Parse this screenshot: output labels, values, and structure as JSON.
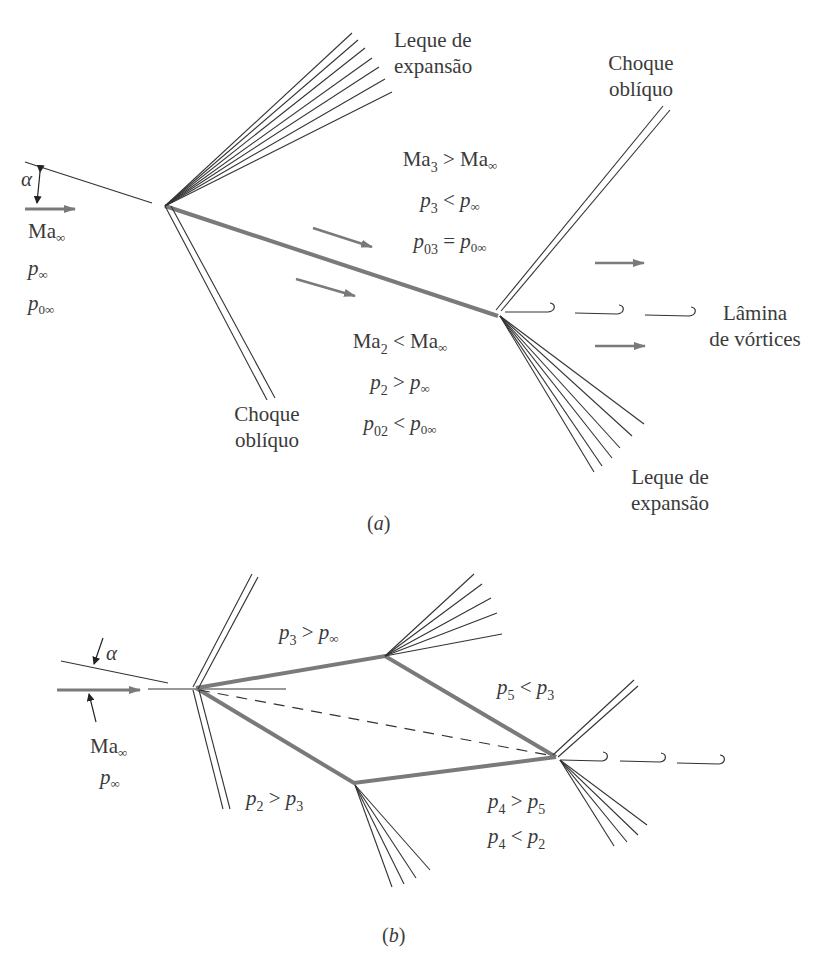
{
  "diagram": {
    "type": "supersonic-airfoil-wave-patterns",
    "colors": {
      "line": "#333333",
      "plate": "#7a7a7a",
      "arrow": "#7a7a7a",
      "text": "#3a3a3a",
      "background": "#ffffff"
    }
  },
  "panel_a": {
    "caption": {
      "open": "(",
      "letter": "a",
      "close": ")"
    },
    "alpha": "α",
    "freestream": {
      "mach": {
        "base": "Ma",
        "sub": "∞"
      },
      "pressure": {
        "base": "p",
        "sub": "∞"
      },
      "total_pressure": {
        "base": "p",
        "sub": "0∞"
      }
    },
    "expansion_fan_top": {
      "line1": "Leque de",
      "line2": "expansão"
    },
    "oblique_shock_bottom": {
      "line1": "Choque",
      "line2": "oblíquo"
    },
    "oblique_shock_top": {
      "line1": "Choque",
      "line2": "oblíquo"
    },
    "vortex_sheet": {
      "line1": "Lâmina",
      "line2": "de vórtices"
    },
    "expansion_fan_bottom": {
      "line1": "Leque de",
      "line2": "expansão"
    },
    "region3": {
      "eq1": {
        "l": "Ma",
        "ls": "3",
        "op": ">",
        "r": "Ma",
        "rs": "∞"
      },
      "eq2": {
        "l": "p",
        "ls": "3",
        "op": "<",
        "r": "p",
        "rs": "∞"
      },
      "eq3": {
        "l": "p",
        "ls": "03",
        "op": "=",
        "r": "p",
        "rs": "0∞"
      }
    },
    "region2": {
      "eq1": {
        "l": "Ma",
        "ls": "2",
        "op": "<",
        "r": "Ma",
        "rs": "∞"
      },
      "eq2": {
        "l": "p",
        "ls": "2",
        "op": ">",
        "r": "p",
        "rs": "∞"
      },
      "eq3": {
        "l": "p",
        "ls": "02",
        "op": "<",
        "r": "p",
        "rs": "0∞"
      }
    }
  },
  "panel_b": {
    "caption": {
      "open": "(",
      "letter": "b",
      "close": ")"
    },
    "alpha": "α",
    "freestream": {
      "mach": {
        "base": "Ma",
        "sub": "∞"
      },
      "pressure": {
        "base": "p",
        "sub": "∞"
      }
    },
    "region3": {
      "l": "p",
      "ls": "3",
      "op": ">",
      "r": "p",
      "rs": "∞"
    },
    "region5": {
      "l": "p",
      "ls": "5",
      "op": "<",
      "r": "p",
      "rs": "3"
    },
    "region2": {
      "l": "p",
      "ls": "2",
      "op": ">",
      "r": "p",
      "rs": "3"
    },
    "region4": {
      "eq1": {
        "l": "p",
        "ls": "4",
        "op": ">",
        "r": "p",
        "rs": "5"
      },
      "eq2": {
        "l": "p",
        "ls": "4",
        "op": "<",
        "r": "p",
        "rs": "2"
      }
    }
  }
}
